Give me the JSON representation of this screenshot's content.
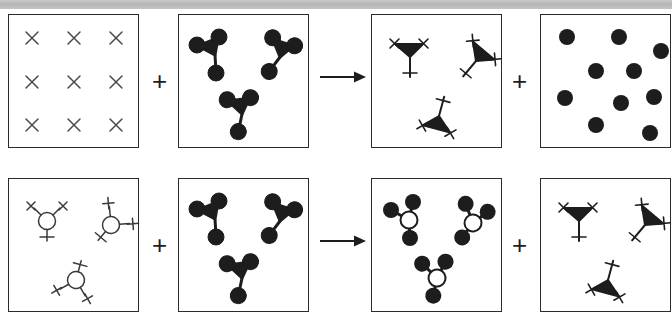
{
  "figure": {
    "type": "reaction-scheme-diagram",
    "top_strip_text": "",
    "rows": [
      {
        "id": "row-1",
        "label": "reaction-row-1",
        "operators": [
          "+",
          "→",
          "+"
        ],
        "panels": [
          {
            "id": "r1p1",
            "name": "panel-substrate-x-grid",
            "content_type": "x-grid",
            "count": 9,
            "items": [
              {
                "glyph": "x-mark",
                "x": 22,
                "y": 22
              },
              {
                "glyph": "x-mark",
                "x": 65,
                "y": 22
              },
              {
                "glyph": "x-mark",
                "x": 108,
                "y": 22
              },
              {
                "glyph": "x-mark",
                "x": 22,
                "y": 67
              },
              {
                "glyph": "x-mark",
                "x": 65,
                "y": 67
              },
              {
                "glyph": "x-mark",
                "x": 108,
                "y": 67
              },
              {
                "glyph": "x-mark",
                "x": 22,
                "y": 112
              },
              {
                "glyph": "x-mark",
                "x": 65,
                "y": 112
              },
              {
                "glyph": "x-mark",
                "x": 112,
                "y": 112
              }
            ]
          },
          {
            "id": "r1p2",
            "name": "panel-tripod-filled",
            "content_type": "tripod-filled-dots",
            "count": 3,
            "items": [
              {
                "glyph": "tripod-filled",
                "x": 36,
                "y": 38,
                "rot": 0
              },
              {
                "glyph": "tripod-filled",
                "x": 100,
                "y": 40,
                "rot": 40
              },
              {
                "glyph": "tripod-filled",
                "x": 62,
                "y": 98,
                "rot": 15
              }
            ]
          },
          {
            "id": "r1p3",
            "name": "panel-tripod-x-tipped",
            "content_type": "tripod-x-tipped",
            "count": 3,
            "items": [
              {
                "glyph": "tripod-x",
                "x": 36,
                "y": 40,
                "rot": 0
              },
              {
                "glyph": "tripod-x",
                "x": 103,
                "y": 44,
                "rot": 40
              },
              {
                "glyph": "tripod-x",
                "x": 66,
                "y": 100,
                "rot": 15
              }
            ]
          },
          {
            "id": "r1p4",
            "name": "panel-free-dots",
            "content_type": "scattered-dots",
            "count": 9,
            "items": [
              {
                "glyph": "dot",
                "x": 23,
                "y": 20
              },
              {
                "glyph": "dot",
                "x": 75,
                "y": 20
              },
              {
                "glyph": "dot",
                "x": 118,
                "y": 33
              },
              {
                "glyph": "dot",
                "x": 52,
                "y": 55
              },
              {
                "glyph": "dot",
                "x": 90,
                "y": 55
              },
              {
                "glyph": "dot",
                "x": 22,
                "y": 82
              },
              {
                "glyph": "dot",
                "x": 77,
                "y": 86
              },
              {
                "glyph": "dot",
                "x": 111,
                "y": 81
              },
              {
                "glyph": "dot",
                "x": 52,
                "y": 110
              },
              {
                "glyph": "dot",
                "x": 106,
                "y": 116
              }
            ]
          }
        ]
      },
      {
        "id": "row-2",
        "label": "reaction-row-2",
        "operators": [
          "+",
          "→",
          "+"
        ],
        "panels": [
          {
            "id": "r2p1",
            "name": "panel-open-circle-x-tripod",
            "content_type": "open-circle-x-tripod",
            "count": 3,
            "items": [
              {
                "glyph": "circle-x-tripod",
                "x": 38,
                "y": 40,
                "rot": 0
              },
              {
                "glyph": "circle-x-tripod",
                "x": 100,
                "y": 44,
                "rot": 40
              },
              {
                "glyph": "circle-x-tripod",
                "x": 66,
                "y": 100,
                "rot": 15
              }
            ]
          },
          {
            "id": "r2p2",
            "name": "panel-tripod-filled",
            "content_type": "tripod-filled-dots",
            "count": 3,
            "items": [
              {
                "glyph": "tripod-filled",
                "x": 36,
                "y": 38,
                "rot": 0
              },
              {
                "glyph": "tripod-filled",
                "x": 100,
                "y": 40,
                "rot": 40
              },
              {
                "glyph": "tripod-filled",
                "x": 62,
                "y": 98,
                "rot": 15
              }
            ]
          },
          {
            "id": "r2p3",
            "name": "panel-open-circle-dot-tripod",
            "content_type": "open-circle-filled-dots",
            "count": 3,
            "items": [
              {
                "glyph": "circle-dot-tripod",
                "x": 36,
                "y": 40,
                "rot": 0
              },
              {
                "glyph": "circle-dot-tripod",
                "x": 100,
                "y": 42,
                "rot": 40
              },
              {
                "glyph": "circle-dot-tripod",
                "x": 64,
                "y": 98,
                "rot": 15
              }
            ]
          },
          {
            "id": "r2p4",
            "name": "panel-tripod-x-tipped",
            "content_type": "tripod-x-tipped",
            "count": 3,
            "items": [
              {
                "glyph": "tripod-x",
                "x": 36,
                "y": 40,
                "rot": 0
              },
              {
                "glyph": "tripod-x",
                "x": 103,
                "y": 44,
                "rot": 40
              },
              {
                "glyph": "tripod-x",
                "x": 66,
                "y": 100,
                "rot": 15
              }
            ]
          }
        ]
      }
    ],
    "colors": {
      "ink": "#2b2b2b",
      "fill": "#1d1d1d",
      "panel_border": "#2b2b2b",
      "x_mark": "#4a4a4a",
      "background": "#ffffff",
      "strip": "#c0c0c0"
    },
    "geometry": {
      "panel_w": 131,
      "panel_h": 134,
      "row1_top": 14,
      "row2_top": 178,
      "panel_x": [
        8,
        178,
        371,
        540
      ]
    }
  }
}
